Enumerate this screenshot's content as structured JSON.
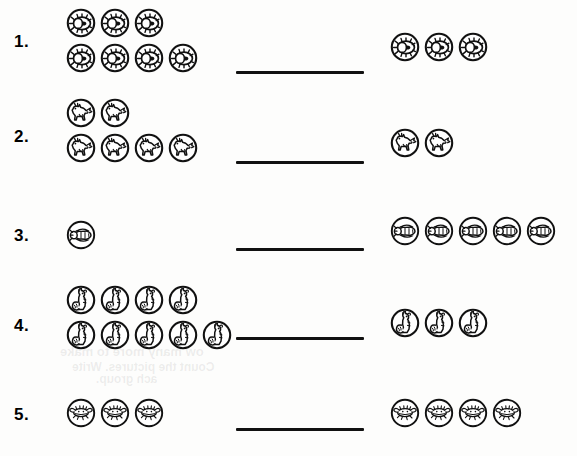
{
  "page": {
    "width": 577,
    "height": 456,
    "background_color": "#fdfdfc",
    "ink_color": "#111111",
    "worksheet_type": "count-and-compare / missing-addend picture worksheet"
  },
  "ghost_text": [
    {
      "text": "ow many more to make",
      "x": 60,
      "y": 344,
      "size": 13
    },
    {
      "text": "Count the pictures. Write",
      "x": 72,
      "y": 360,
      "size": 12
    },
    {
      "text": "ach group.",
      "x": 96,
      "y": 372,
      "size": 12
    }
  ],
  "answer_line": {
    "label": "blank answer line",
    "left": 236,
    "width": 128,
    "thickness": 3
  },
  "problems": [
    {
      "number": "1.",
      "number_y": 32,
      "line_y": 71,
      "icon": "beetle-icon",
      "left_group": {
        "x": 64,
        "y": 6,
        "rows": [
          3,
          4
        ],
        "count": 7
      },
      "right_group": {
        "x": 388,
        "y": 30,
        "rows": [
          3
        ],
        "count": 3
      }
    },
    {
      "number": "2.",
      "number_y": 127,
      "line_y": 161,
      "icon": "horse-icon",
      "left_group": {
        "x": 64,
        "y": 96,
        "rows": [
          2,
          4
        ],
        "count": 6
      },
      "right_group": {
        "x": 388,
        "y": 126,
        "rows": [
          2
        ],
        "count": 2
      }
    },
    {
      "number": "3.",
      "number_y": 226,
      "line_y": 248,
      "icon": "bee-icon",
      "left_group": {
        "x": 64,
        "y": 218,
        "rows": [
          1
        ],
        "count": 1
      },
      "right_group": {
        "x": 388,
        "y": 214,
        "rows": [
          5
        ],
        "count": 5
      }
    },
    {
      "number": "4.",
      "number_y": 316,
      "line_y": 337,
      "icon": "squirrel-icon",
      "left_group": {
        "x": 64,
        "y": 283,
        "rows": [
          4,
          5
        ],
        "count": 9
      },
      "right_group": {
        "x": 388,
        "y": 306,
        "rows": [
          3
        ],
        "count": 3
      }
    },
    {
      "number": "5.",
      "number_y": 405,
      "line_y": 428,
      "icon": "crab-icon",
      "left_group": {
        "x": 64,
        "y": 396,
        "rows": [
          3
        ],
        "count": 3
      },
      "right_group": {
        "x": 388,
        "y": 396,
        "rows": [
          4
        ],
        "count": 4
      }
    }
  ],
  "chart_data": {
    "type": "table",
    "columns": [
      "problem",
      "icon",
      "left_count",
      "right_count"
    ],
    "rows": [
      [
        "1.",
        "beetle-icon",
        7,
        3
      ],
      [
        "2.",
        "horse-icon",
        6,
        2
      ],
      [
        "3.",
        "bee-icon",
        1,
        5
      ],
      [
        "4.",
        "squirrel-icon",
        9,
        3
      ],
      [
        "5.",
        "crab-icon",
        3,
        4
      ]
    ]
  }
}
